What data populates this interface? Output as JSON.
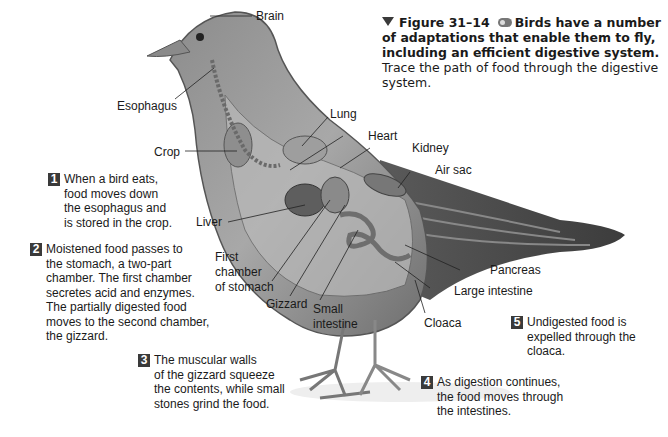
{
  "caption": {
    "figure_label": "Figure 31–14",
    "icon": "eye-icon",
    "bold_text": "Birds have a number of adaptations that enable them to fly, including an efficient digestive system.",
    "plain_text": " Trace the path of food through the digestive system."
  },
  "labels": {
    "brain": "Brain",
    "esophagus": "Esophagus",
    "crop": "Crop",
    "lung": "Lung",
    "heart": "Heart",
    "kidney": "Kidney",
    "air_sac": "Air sac",
    "liver": "Liver",
    "first_chamber": "First\nchamber\nof stomach",
    "gizzard": "Gizzard",
    "small_intestine": "Small\nintestine",
    "pancreas": "Pancreas",
    "large_intestine": "Large intestine",
    "cloaca": "Cloaca"
  },
  "steps": [
    {
      "number": "1",
      "text": "When a bird eats,\nfood moves down\nthe esophagus and\nis stored in the crop."
    },
    {
      "number": "2",
      "text": "Moistened food passes to\nthe stomach, a two-part\nchamber. The first chamber\nsecretes acid and enzymes.\nThe partially digested food\nmoves to the second chamber,\nthe gizzard."
    },
    {
      "number": "3",
      "text": "The muscular walls\nof the gizzard squeeze\nthe contents, while small\nstones grind the food."
    },
    {
      "number": "4",
      "text": "As digestion continues,\nthe food moves through\nthe intestines."
    },
    {
      "number": "5",
      "text": "Undigested food is\nexpelled through the\ncloaca."
    }
  ],
  "colors": {
    "step_badge": "#3a3a3a",
    "bird_body": "#9a9a9a",
    "organ_fill": "#7d7d7d"
  }
}
